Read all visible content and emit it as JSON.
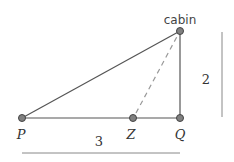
{
  "diagram": {
    "points": {
      "cabin": {
        "label": "cabin",
        "x": 180,
        "y": 31
      },
      "P": {
        "label": "P",
        "x": 22,
        "y": 118
      },
      "Z": {
        "label": "Z",
        "x": 133,
        "y": 118
      },
      "Q": {
        "label": "Q",
        "x": 180,
        "y": 118
      }
    },
    "measures": {
      "horizontal": {
        "label": "3"
      },
      "vertical": {
        "label": "2"
      }
    },
    "colors": {
      "line": "#555555",
      "dashed": "#999999",
      "point_fill": "#808080",
      "point_stroke": "#444444",
      "measure_line": "#888888"
    }
  }
}
